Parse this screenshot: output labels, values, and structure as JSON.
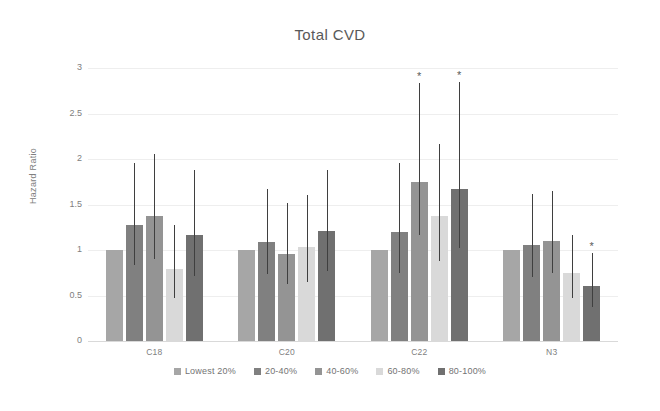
{
  "chart_data": {
    "type": "bar",
    "title": "Total CVD",
    "xlabel": "",
    "ylabel": "Hazard Ratio",
    "ylim": [
      0,
      3
    ],
    "ytick_labels": [
      "0",
      "0.5",
      "1",
      "1.5",
      "2",
      "2.5",
      "3"
    ],
    "ytick_values": [
      0,
      0.5,
      1,
      1.5,
      2,
      2.5,
      3
    ],
    "grid": true,
    "legend_position": "bottom",
    "categories": [
      "C18",
      "C20",
      "C22",
      "N3"
    ],
    "series": [
      {
        "name": "Lowest 20%",
        "color": "#a6a6a6",
        "values": [
          1.0,
          1.0,
          1.0,
          1.0
        ],
        "ci_low": [
          null,
          null,
          null,
          null
        ],
        "ci_high": [
          null,
          null,
          null,
          null
        ],
        "significant": [
          false,
          false,
          false,
          false
        ]
      },
      {
        "name": "20-40%",
        "color": "#808080",
        "values": [
          1.28,
          1.09,
          1.2,
          1.06
        ],
        "ci_low": [
          0.83,
          0.74,
          0.75,
          0.7
        ],
        "ci_high": [
          1.96,
          1.67,
          1.96,
          1.62
        ],
        "significant": [
          false,
          false,
          false,
          false
        ]
      },
      {
        "name": "40-60%",
        "color": "#949494",
        "values": [
          1.37,
          0.96,
          1.75,
          1.1
        ],
        "ci_low": [
          0.9,
          0.63,
          1.16,
          0.75
        ],
        "ci_high": [
          2.06,
          1.52,
          2.83,
          1.65
        ],
        "significant": [
          false,
          false,
          true,
          false
        ]
      },
      {
        "name": "60-80%",
        "color": "#d9d9d9",
        "values": [
          0.79,
          1.03,
          1.37,
          0.75
        ],
        "ci_low": [
          0.47,
          0.65,
          0.88,
          0.47
        ],
        "ci_high": [
          1.28,
          1.6,
          2.16,
          1.17
        ],
        "significant": [
          false,
          false,
          false,
          false
        ]
      },
      {
        "name": "80-100%",
        "color": "#707070",
        "values": [
          1.16,
          1.21,
          1.67,
          0.61
        ],
        "ci_low": [
          0.71,
          0.77,
          1.02,
          0.37
        ],
        "ci_high": [
          1.88,
          1.88,
          2.85,
          0.97
        ],
        "significant": [
          false,
          false,
          true,
          true
        ]
      }
    ],
    "significance_marker": "*"
  },
  "axes": {
    "title_color": "#595959",
    "tick_color": "#808080",
    "grid_color": "#eeeeee",
    "error_bar_color": "#3f3f3f"
  }
}
